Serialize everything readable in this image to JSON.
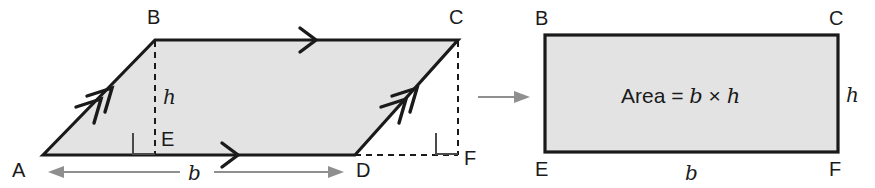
{
  "diagram": {
    "colors": {
      "fill": "#e3e3e3",
      "stroke": "#1a1a1a",
      "dashed": "#1a1a1a",
      "dimension_arrow": "#8f8f8f",
      "transition_arrow": "#8f8f8f",
      "text": "#1a1a1a",
      "background": "#ffffff"
    },
    "parallelogram": {
      "name": "parallelogram-ABCD",
      "vertices": [
        {
          "label": "A",
          "x": 43,
          "y": 155
        },
        {
          "label": "B",
          "x": 155,
          "y": 40
        },
        {
          "label": "C",
          "x": 458,
          "y": 40
        },
        {
          "label": "D",
          "x": 355,
          "y": 155
        }
      ],
      "vertex_labels": {
        "A": "A",
        "B": "B",
        "C": "C",
        "D": "D",
        "E": "E",
        "F": "F"
      },
      "height_label": "h",
      "base_label": "b",
      "tick_marks": {
        "side_AB": "double-chevron",
        "side_DC": "double-chevron",
        "side_BC": "single-chevron",
        "side_AD": "single-chevron"
      }
    },
    "rectangle": {
      "name": "rectangle-BCFE",
      "bounds": {
        "left": 545,
        "top": 35,
        "right": 838,
        "bottom": 152
      },
      "vertex_labels": {
        "top_left": "B",
        "top_right": "C",
        "bottom_left": "E",
        "bottom_right": "F"
      },
      "height_label": "h",
      "base_label": "b",
      "area_text": {
        "word": "Area",
        "equals": "=",
        "base": "b",
        "times": "×",
        "height": "h",
        "full": "Area = b × h"
      }
    },
    "transition_arrow": {
      "name": "transformation-arrow",
      "from_x": 478,
      "to_x": 528,
      "y": 97
    }
  }
}
